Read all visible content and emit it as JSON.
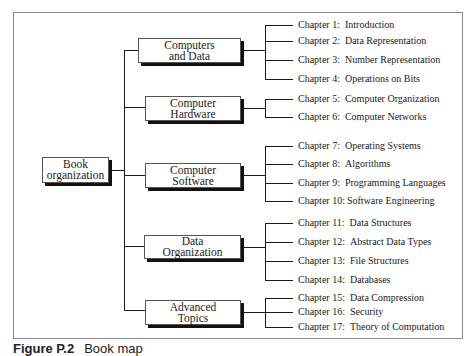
{
  "diagram": {
    "root": {
      "label": "Book\norganization"
    },
    "categories": [
      {
        "label": "Computers\nand Data"
      },
      {
        "label": "Computer\nHardware"
      },
      {
        "label": "Computer\nSoftware"
      },
      {
        "label": "Data\nOrganization"
      },
      {
        "label": "Advanced\nTopics"
      }
    ],
    "chapters": [
      {
        "num": "Chapter 1:",
        "title": "Introduction"
      },
      {
        "num": "Chapter 2:",
        "title": "Data Representation"
      },
      {
        "num": "Chapter 3:",
        "title": "Number Representation"
      },
      {
        "num": "Chapter 4:",
        "title": "Operations on Bits"
      },
      {
        "num": "Chapter 5:",
        "title": "Computer Organization"
      },
      {
        "num": "Chapter 6:",
        "title": "Computer Networks"
      },
      {
        "num": "Chapter 7:",
        "title": "Operating Systems"
      },
      {
        "num": "Chapter 8:",
        "title": "Algorithms"
      },
      {
        "num": "Chapter 9:",
        "title": "Programming Languages"
      },
      {
        "num": "Chapter 10:",
        "title": "Software Engineering"
      },
      {
        "num": "Chapter 11:",
        "title": "Data Structures"
      },
      {
        "num": "Chapter 12:",
        "title": "Abstract Data Types"
      },
      {
        "num": "Chapter 13:",
        "title": "File Structures"
      },
      {
        "num": "Chapter 14:",
        "title": "Databases"
      },
      {
        "num": "Chapter 15:",
        "title": "Data Compression"
      },
      {
        "num": "Chapter 16:",
        "title": "Security"
      },
      {
        "num": "Chapter 17:",
        "title": "Theory of Computation"
      }
    ],
    "caption": {
      "label": "Figure P.2",
      "text": "Book map"
    }
  }
}
